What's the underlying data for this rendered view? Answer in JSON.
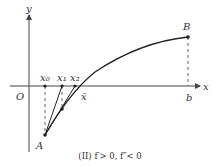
{
  "figure": {
    "caption": "(II) f′> 0, f″< 0",
    "axes": {
      "x_label": "x",
      "y_label": "y",
      "origin_label": "O"
    },
    "points": {
      "A": "A",
      "B": "B",
      "b": "b",
      "x0": "x₀",
      "x1": "x₁",
      "x2": "x₂",
      "xbar": "x̄"
    },
    "colors": {
      "stroke": "#222222",
      "axis": "#444444"
    }
  }
}
